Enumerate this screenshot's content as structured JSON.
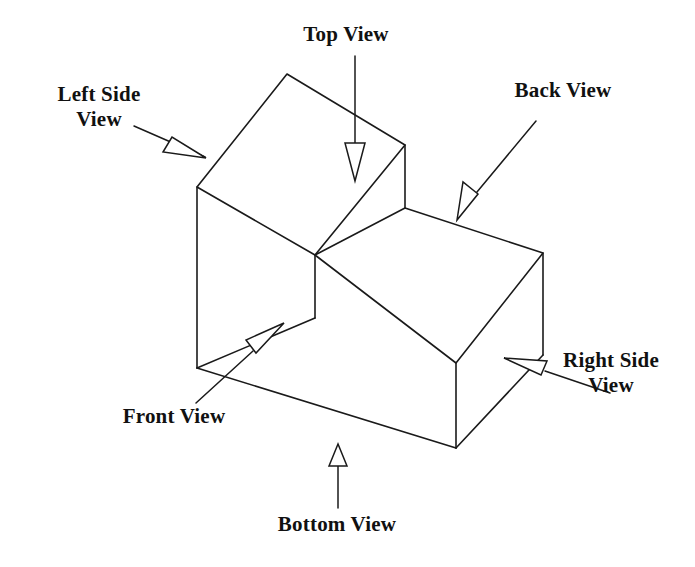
{
  "figure": {
    "object_shape": "L-shaped stepped rectangular block",
    "background_color": "#ffffff",
    "line_color": "#1a1a1a",
    "arrowhead_style": "open outline triangle",
    "label_count": 6
  },
  "labels": {
    "left_side": {
      "text": "Left Side\nView",
      "name": "Left Side View",
      "arrow_direction": "down-right"
    },
    "top": {
      "text": "Top View",
      "name": "Top View",
      "arrow_direction": "down"
    },
    "back": {
      "text": "Back View",
      "name": "Back View",
      "arrow_direction": "down-left"
    },
    "right_side": {
      "text": "Right Side\nView",
      "name": "Right Side View",
      "arrow_direction": "left"
    },
    "front": {
      "text": "Front View",
      "name": "Front View",
      "arrow_direction": "up-right"
    },
    "bottom": {
      "text": "Bottom View",
      "name": "Bottom View",
      "arrow_direction": "up"
    }
  },
  "geometry": {
    "solid_outline": "M 197,187 L 287,74 L 405,145 L 405,208 L 543,253 L 543,355 L 456,448 L 198,368 Z",
    "top_face_tall": "M 197,187 L 287,74 L 405,145 L 315,255 Z",
    "step_top_face": "M 315,255 L 405,208 L 543,253 L 456,363 Z",
    "front_face_tall": "M 197,187 L 315,255 L 315,318 L 198,368 Z",
    "front_face_low": "M 315,318 L 456,363 L 456,448 L 198,368 Z",
    "right_face": "M 456,363 L 543,253 L 543,355 L 456,448 Z",
    "step_riser": "M 315,255 L 405,208 L 405,145",
    "inner_vertical_edge": "M 315,255 L 315,318"
  }
}
